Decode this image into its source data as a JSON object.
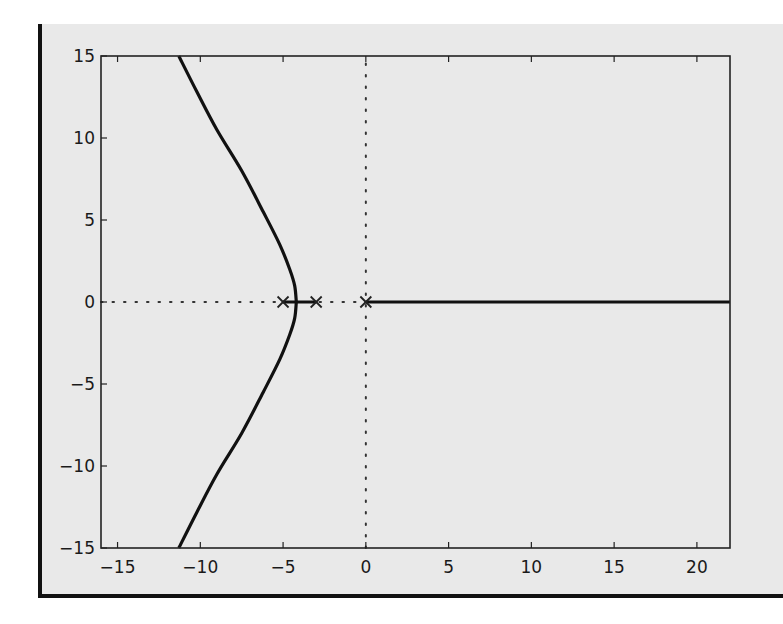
{
  "chart_data": {
    "type": "line",
    "title": "",
    "subtitle": "",
    "xlabel": "",
    "ylabel": "",
    "xlim": [
      -16,
      22
    ],
    "ylim": [
      -15,
      15
    ],
    "grid": false,
    "legend": null,
    "x_ticks": [
      -15,
      -10,
      -5,
      0,
      5,
      10,
      15,
      20
    ],
    "x_tick_labels": [
      "−15",
      "−10",
      "−5",
      "0",
      "5",
      "10",
      "15",
      "20"
    ],
    "y_ticks": [
      15,
      10,
      5,
      0,
      -5,
      -10,
      -15
    ],
    "y_tick_labels": [
      "15",
      "10",
      "5",
      "0",
      "−5",
      "−10",
      "−15"
    ],
    "poles": [
      {
        "re": 0,
        "im": 0,
        "marker": "x"
      },
      {
        "re": -3,
        "im": 0,
        "marker": "x"
      },
      {
        "re": -5,
        "im": 0,
        "marker": "x"
      }
    ],
    "reference_lines": [
      {
        "orientation": "horizontal",
        "value": 0,
        "style": "dotted",
        "span_x": [
          -16,
          0
        ]
      },
      {
        "orientation": "vertical",
        "value": 0,
        "style": "dotted",
        "span_y": [
          -15,
          15
        ]
      }
    ],
    "series": [
      {
        "name": "real-axis-branch-right",
        "x": [
          0,
          22
        ],
        "y": [
          0,
          0
        ]
      },
      {
        "name": "real-axis-branch-between",
        "x": [
          -5,
          -3
        ],
        "y": [
          0,
          0
        ]
      },
      {
        "name": "upper-branch",
        "x": [
          -4.2,
          -4.3,
          -4.6,
          -5.2,
          -6.2,
          -7.5,
          -9.0,
          -10.2,
          -11.3
        ],
        "y": [
          0,
          1,
          2,
          3.5,
          5.5,
          8,
          10.5,
          12.8,
          15
        ]
      },
      {
        "name": "lower-branch",
        "x": [
          -4.2,
          -4.3,
          -4.6,
          -5.2,
          -6.2,
          -7.5,
          -9.0,
          -10.2,
          -11.3
        ],
        "y": [
          0,
          -1,
          -2,
          -3.5,
          -5.5,
          -8,
          -10.5,
          -12.8,
          -15
        ]
      }
    ],
    "colors": {
      "line": "#111111",
      "axis": "#222222",
      "background": "#e9e9e9"
    }
  }
}
